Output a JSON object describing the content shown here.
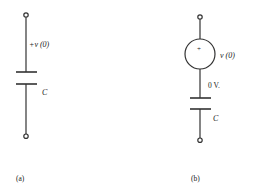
{
  "diagram": {
    "circuit_a": {
      "voltage_label": "+v (0)",
      "capacitor_label": "C",
      "caption": "(a)"
    },
    "circuit_b": {
      "source_polarity": "+",
      "source_label": "v (0)",
      "node_voltage_label": "0 V.",
      "capacitor_label": "C",
      "caption": "(b)"
    }
  }
}
